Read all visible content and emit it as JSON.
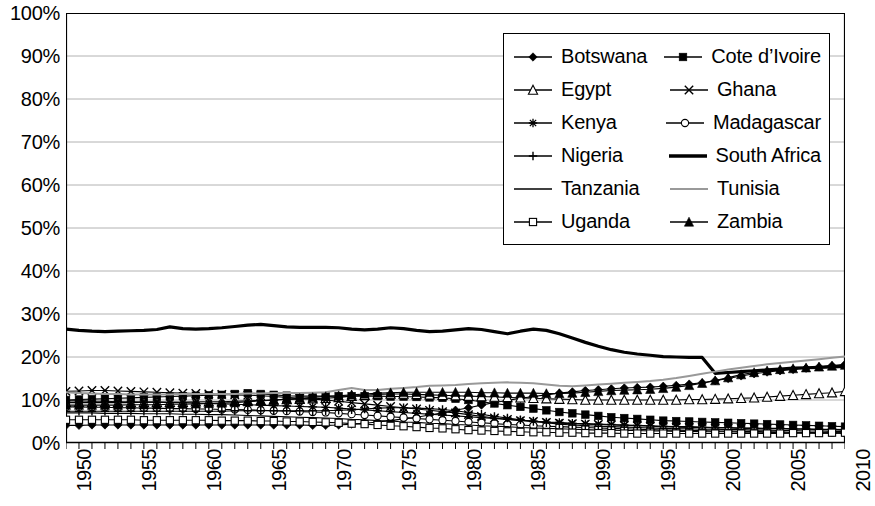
{
  "chart_data": {
    "type": "line",
    "title": "",
    "xlabel": "",
    "ylabel": "",
    "xlim": [
      1950,
      2010
    ],
    "ylim": [
      0,
      1.0
    ],
    "grid": true,
    "legend_position": "top-right",
    "y_tick_labels": [
      "100%",
      "90%",
      "80%",
      "70%",
      "60%",
      "50%",
      "40%",
      "30%",
      "20%",
      "10%",
      "0%"
    ],
    "y_tick_values": [
      1.0,
      0.9,
      0.8,
      0.7,
      0.6,
      0.5,
      0.4,
      0.3,
      0.2,
      0.1,
      0.0
    ],
    "x_tick_labels": [
      "1950",
      "1955",
      "1960",
      "1965",
      "1970",
      "1975",
      "1980",
      "1985",
      "1990",
      "1995",
      "2000",
      "2005",
      "2010"
    ],
    "x_tick_values": [
      1950,
      1955,
      1960,
      1965,
      1970,
      1975,
      1980,
      1985,
      1990,
      1995,
      2000,
      2005,
      2010
    ],
    "x": [
      1950,
      1951,
      1952,
      1953,
      1954,
      1955,
      1956,
      1957,
      1958,
      1959,
      1960,
      1961,
      1962,
      1963,
      1964,
      1965,
      1966,
      1967,
      1968,
      1969,
      1970,
      1971,
      1972,
      1973,
      1974,
      1975,
      1976,
      1977,
      1978,
      1979,
      1980,
      1981,
      1982,
      1983,
      1984,
      1985,
      1986,
      1987,
      1988,
      1989,
      1990,
      1991,
      1992,
      1993,
      1994,
      1995,
      1996,
      1997,
      1998,
      1999,
      2000,
      2001,
      2002,
      2003,
      2004,
      2005,
      2006,
      2007,
      2008,
      2009,
      2010
    ],
    "series": [
      {
        "name": "Botswana",
        "marker": "filled-diamond",
        "color": "#000000",
        "values": [
          4.1,
          4.1,
          4.2,
          4.2,
          4.2,
          4.2,
          4.2,
          4.2,
          4.2,
          4.2,
          4.2,
          4.2,
          4.2,
          4.2,
          4.2,
          4.2,
          4.2,
          4.2,
          4.2,
          4.1,
          4.1,
          4.2,
          4.4,
          4.6,
          4.9,
          5.2,
          5.6,
          6.0,
          6.5,
          7.0,
          7.6,
          8.2,
          8.8,
          9.4,
          9.9,
          10.4,
          10.8,
          11.2,
          11.6,
          11.9,
          12.2,
          12.4,
          12.6,
          12.8,
          12.9,
          13.0,
          13.2,
          13.4,
          13.7,
          14.0,
          14.5,
          15.0,
          15.6,
          16.1,
          16.5,
          16.8,
          17.1,
          17.4,
          17.7,
          18.0,
          18.3
        ]
      },
      {
        "name": "Cote d'Ivoire",
        "marker": "filled-square",
        "color": "#000000",
        "values": [
          10.0,
          10.1,
          10.2,
          10.3,
          10.4,
          10.5,
          10.6,
          10.7,
          10.8,
          10.9,
          11.0,
          11.1,
          11.2,
          11.4,
          11.6,
          11.4,
          11.2,
          11.0,
          10.9,
          10.9,
          10.9,
          10.9,
          10.9,
          10.9,
          10.9,
          10.8,
          10.8,
          10.7,
          10.6,
          10.5,
          10.3,
          10.0,
          9.6,
          9.2,
          8.8,
          8.4,
          8.0,
          7.6,
          7.2,
          6.9,
          6.6,
          6.3,
          6.0,
          5.8,
          5.6,
          5.4,
          5.2,
          5.1,
          5.0,
          4.9,
          4.8,
          4.7,
          4.6,
          4.5,
          4.4,
          4.3,
          4.2,
          4.1,
          4.0,
          3.9,
          3.8
        ]
      },
      {
        "name": "Egypt",
        "marker": "open-triangle",
        "color": "#000000",
        "values": [
          9.4,
          9.4,
          9.4,
          9.4,
          9.4,
          9.4,
          9.5,
          9.5,
          9.5,
          9.5,
          9.6,
          9.6,
          9.6,
          9.7,
          9.8,
          9.9,
          10.0,
          10.1,
          10.2,
          10.3,
          10.4,
          10.6,
          10.9,
          11.1,
          11.3,
          11.4,
          11.4,
          11.3,
          11.2,
          11.1,
          11.0,
          10.9,
          10.8,
          10.7,
          10.6,
          10.5,
          10.4,
          10.3,
          10.2,
          10.1,
          10.0,
          10.0,
          10.0,
          10.0,
          10.0,
          10.0,
          10.0,
          10.0,
          10.1,
          10.1,
          10.2,
          10.3,
          10.4,
          10.5,
          10.7,
          10.9,
          11.1,
          11.3,
          11.5,
          11.7,
          12.0
        ]
      },
      {
        "name": "Ghana",
        "marker": "x-cross",
        "color": "#000000",
        "values": [
          12.0,
          12.1,
          12.2,
          12.2,
          12.1,
          12.0,
          11.9,
          11.8,
          11.7,
          11.6,
          11.5,
          11.4,
          11.3,
          11.2,
          11.1,
          11.0,
          10.8,
          10.6,
          10.4,
          10.2,
          10.0,
          9.7,
          9.4,
          9.1,
          8.8,
          8.5,
          8.2,
          7.9,
          7.6,
          7.3,
          7.0,
          6.6,
          6.2,
          5.8,
          5.5,
          5.2,
          5.0,
          4.8,
          4.6,
          4.5,
          4.4,
          4.3,
          4.2,
          4.1,
          4.0,
          3.9,
          3.8,
          3.7,
          3.6,
          3.6,
          3.5,
          3.5,
          3.4,
          3.4,
          3.3,
          3.3,
          3.2,
          3.2,
          3.1,
          3.1,
          3.0
        ]
      },
      {
        "name": "Kenya",
        "marker": "star",
        "color": "#000000",
        "values": [
          9.8,
          9.8,
          9.7,
          9.7,
          9.6,
          9.6,
          9.5,
          9.5,
          9.4,
          9.4,
          9.3,
          9.2,
          9.1,
          9.0,
          8.9,
          8.8,
          8.7,
          8.6,
          8.5,
          8.4,
          8.3,
          8.1,
          7.9,
          7.7,
          7.5,
          7.3,
          7.1,
          6.9,
          6.7,
          6.5,
          6.3,
          6.1,
          5.9,
          5.7,
          5.5,
          5.3,
          5.1,
          4.9,
          4.8,
          4.6,
          4.5,
          4.4,
          4.3,
          4.2,
          4.1,
          4.0,
          3.9,
          3.8,
          3.8,
          3.7,
          3.6,
          3.6,
          3.5,
          3.5,
          3.4,
          3.4,
          3.3,
          3.3,
          3.2,
          3.2,
          3.1
        ]
      },
      {
        "name": "Madagascar",
        "marker": "open-circle",
        "color": "#000000",
        "values": [
          8.4,
          8.4,
          8.3,
          8.3,
          8.2,
          8.2,
          8.1,
          8.1,
          8.0,
          8.0,
          7.9,
          7.9,
          7.8,
          7.8,
          7.7,
          7.6,
          7.5,
          7.4,
          7.3,
          7.2,
          7.1,
          6.9,
          6.7,
          6.5,
          6.3,
          6.1,
          5.9,
          5.7,
          5.5,
          5.3,
          5.1,
          4.9,
          4.7,
          4.5,
          4.3,
          4.2,
          4.0,
          3.9,
          3.8,
          3.7,
          3.6,
          3.5,
          3.4,
          3.3,
          3.2,
          3.1,
          3.0,
          3.0,
          2.9,
          2.9,
          2.8,
          2.8,
          2.7,
          2.7,
          2.6,
          2.6,
          2.5,
          2.5,
          2.4,
          2.4,
          2.3
        ]
      },
      {
        "name": "Nigeria",
        "marker": "plus",
        "color": "#000000",
        "values": [
          7.4,
          7.4,
          7.4,
          7.4,
          7.4,
          7.4,
          7.4,
          7.4,
          7.4,
          7.4,
          7.4,
          7.4,
          7.4,
          7.5,
          7.5,
          7.5,
          7.5,
          7.5,
          7.5,
          7.5,
          7.5,
          7.6,
          7.7,
          7.9,
          8.1,
          8.2,
          8.2,
          8.1,
          8.0,
          7.8,
          7.5,
          7.1,
          6.7,
          6.2,
          5.8,
          5.4,
          5.0,
          4.7,
          4.4,
          4.2,
          4.0,
          3.9,
          3.8,
          3.7,
          3.6,
          3.5,
          3.4,
          3.3,
          3.3,
          3.2,
          3.2,
          3.1,
          3.1,
          3.0,
          3.0,
          2.9,
          2.9,
          2.8,
          2.8,
          2.7,
          2.7
        ]
      },
      {
        "name": "South Africa",
        "marker": "thick-line",
        "color": "#000000",
        "values": [
          26.5,
          26.2,
          26.0,
          25.9,
          26.0,
          26.1,
          26.2,
          26.4,
          27.0,
          26.6,
          26.5,
          26.6,
          26.8,
          27.1,
          27.4,
          27.6,
          27.3,
          27.0,
          26.9,
          26.9,
          26.9,
          26.8,
          26.5,
          26.3,
          26.5,
          26.8,
          26.6,
          26.2,
          25.9,
          26.0,
          26.3,
          26.6,
          26.4,
          25.9,
          25.4,
          26.0,
          26.5,
          26.2,
          25.4,
          24.4,
          23.4,
          22.5,
          21.7,
          21.1,
          20.7,
          20.4,
          20.1,
          20.0,
          19.9,
          19.9,
          16.2,
          16.4,
          16.6,
          16.8,
          17.0,
          17.2,
          17.4,
          17.5,
          17.6,
          17.7,
          17.8
        ]
      },
      {
        "name": "Tanzania",
        "marker": "thin-line",
        "color": "#000000",
        "values": [
          7.0,
          7.0,
          7.0,
          6.9,
          6.9,
          6.9,
          6.8,
          6.8,
          6.8,
          6.7,
          6.7,
          6.6,
          6.6,
          6.5,
          6.4,
          6.3,
          6.2,
          6.1,
          6.0,
          5.9,
          5.8,
          5.7,
          5.5,
          5.4,
          5.2,
          5.1,
          4.9,
          4.8,
          4.6,
          4.5,
          4.3,
          4.2,
          4.0,
          3.9,
          3.8,
          3.6,
          3.5,
          3.4,
          3.3,
          3.2,
          3.1,
          3.0,
          3.0,
          2.9,
          2.9,
          2.8,
          2.8,
          2.7,
          2.7,
          2.6,
          2.6,
          2.6,
          2.5,
          2.5,
          2.5,
          2.4,
          2.4,
          2.4,
          2.3,
          2.3,
          2.3
        ]
      },
      {
        "name": "Tunisia",
        "marker": "gray-line",
        "color": "#999999",
        "values": [
          11.8,
          11.6,
          11.5,
          11.4,
          11.4,
          11.3,
          11.3,
          11.3,
          11.3,
          11.4,
          11.4,
          11.4,
          11.4,
          11.4,
          11.5,
          11.5,
          11.6,
          11.6,
          11.6,
          11.7,
          11.8,
          12.3,
          12.8,
          12.3,
          12.3,
          12.6,
          12.8,
          13.0,
          13.3,
          13.4,
          13.5,
          13.7,
          13.9,
          14.0,
          14.1,
          14.0,
          13.9,
          13.6,
          13.3,
          13.2,
          13.4,
          13.6,
          13.8,
          14.0,
          14.2,
          14.4,
          14.7,
          15.1,
          15.6,
          16.1,
          16.6,
          17.1,
          17.5,
          17.9,
          18.3,
          18.6,
          18.9,
          19.2,
          19.5,
          19.8,
          20.1
        ]
      },
      {
        "name": "Uganda",
        "marker": "open-square",
        "color": "#000000",
        "values": [
          5.4,
          5.4,
          5.4,
          5.4,
          5.4,
          5.4,
          5.3,
          5.3,
          5.3,
          5.3,
          5.3,
          5.3,
          5.2,
          5.2,
          5.2,
          5.1,
          5.1,
          5.0,
          5.0,
          4.9,
          4.8,
          4.7,
          4.5,
          4.4,
          4.2,
          4.0,
          3.9,
          3.7,
          3.5,
          3.4,
          3.2,
          3.0,
          2.9,
          2.8,
          2.7,
          2.6,
          2.5,
          2.5,
          2.4,
          2.4,
          2.3,
          2.3,
          2.3,
          2.2,
          2.2,
          2.2,
          2.2,
          2.2,
          2.2,
          2.2,
          2.2,
          2.2,
          2.2,
          2.2,
          2.2,
          2.2,
          2.3,
          2.3,
          2.3,
          2.4,
          2.4
        ]
      },
      {
        "name": "Zambia",
        "marker": "filled-triangle",
        "color": "#000000",
        "values": [
          8.8,
          8.8,
          8.8,
          8.8,
          8.8,
          8.9,
          8.9,
          8.9,
          9.0,
          9.0,
          9.1,
          9.2,
          9.3,
          9.4,
          9.6,
          9.8,
          10.0,
          10.2,
          10.4,
          10.6,
          10.8,
          11.0,
          11.2,
          11.4,
          11.6,
          11.7,
          11.8,
          11.8,
          11.8,
          11.8,
          11.8,
          11.8,
          11.7,
          11.7,
          11.6,
          11.6,
          11.6,
          11.5,
          11.5,
          11.6,
          11.8,
          12.0,
          12.2,
          12.3,
          12.4,
          12.5,
          12.7,
          13.0,
          13.4,
          13.9,
          14.5,
          15.2,
          15.9,
          16.4,
          16.8,
          17.1,
          17.3,
          17.5,
          17.7,
          17.9,
          18.1
        ]
      }
    ]
  },
  "legend": {
    "rows": [
      {
        "left": {
          "label": "Botswana",
          "marker": "filled-diamond"
        },
        "right": {
          "label": "Cote d’Ivoire",
          "marker": "filled-square"
        }
      },
      {
        "left": {
          "label": "Egypt",
          "marker": "open-triangle"
        },
        "right": {
          "label": "Ghana",
          "marker": "x-cross"
        }
      },
      {
        "left": {
          "label": "Kenya",
          "marker": "star"
        },
        "right": {
          "label": "Madagascar",
          "marker": "open-circle"
        }
      },
      {
        "left": {
          "label": "Nigeria",
          "marker": "plus"
        },
        "right": {
          "label": "South Africa",
          "marker": "thick-line"
        }
      },
      {
        "left": {
          "label": "Tanzania",
          "marker": "thin-line"
        },
        "right": {
          "label": "Tunisia",
          "marker": "gray-line"
        }
      },
      {
        "left": {
          "label": "Uganda",
          "marker": "open-square"
        },
        "right": {
          "label": "Zambia",
          "marker": "filled-triangle"
        }
      }
    ]
  },
  "colors": {
    "series_default": "#000000",
    "tunisia_gray": "#999999",
    "gridline": "#a0a0a0",
    "axis": "#000000",
    "background": "#ffffff"
  }
}
